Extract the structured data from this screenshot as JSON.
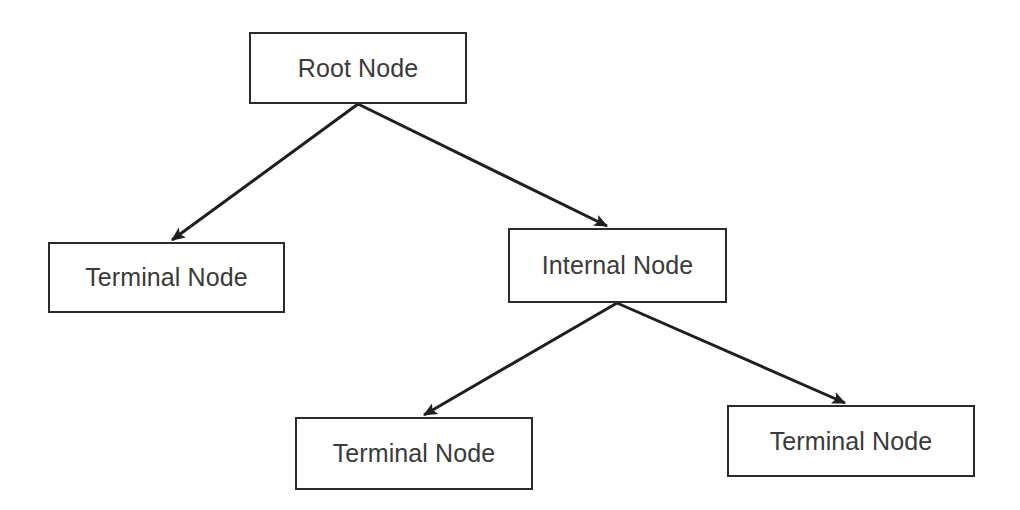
{
  "diagram": {
    "type": "tree-diagram",
    "canvas": {
      "width": 1020,
      "height": 510
    },
    "style": {
      "background_color": "#ffffff",
      "box_fill_color": "#ffffff",
      "box_border_color": "#2b2b2b",
      "box_border_width": 2,
      "text_color": "#3a3a3a",
      "edge_color": "#1f1f1f",
      "edge_width": 3,
      "font_size": 25
    },
    "nodes": [
      {
        "id": "root",
        "label": "Root Node",
        "x": 249,
        "y": 32,
        "width": 218,
        "height": 72,
        "level": 0
      },
      {
        "id": "terminal-1",
        "label": "Terminal Node",
        "x": 48,
        "y": 242,
        "width": 237,
        "height": 71,
        "level": 1
      },
      {
        "id": "internal",
        "label": "Internal Node",
        "x": 508,
        "y": 228,
        "width": 219,
        "height": 75,
        "level": 1
      },
      {
        "id": "terminal-2",
        "label": "Terminal Node",
        "x": 295,
        "y": 417,
        "width": 238,
        "height": 73,
        "level": 2
      },
      {
        "id": "terminal-3",
        "label": "Terminal Node",
        "x": 727,
        "y": 405,
        "width": 248,
        "height": 72,
        "level": 2
      }
    ],
    "edges": [
      {
        "id": "root-to-terminal-1",
        "from": "root",
        "to": "terminal-1",
        "x1": 358,
        "y1": 104,
        "x2": 172,
        "y2": 240,
        "arrowhead": "filled-triangle"
      },
      {
        "id": "root-to-internal",
        "from": "root",
        "to": "internal",
        "x1": 358,
        "y1": 104,
        "x2": 607,
        "y2": 226,
        "arrowhead": "filled-triangle"
      },
      {
        "id": "internal-to-terminal-2",
        "from": "internal",
        "to": "terminal-2",
        "x1": 617,
        "y1": 303,
        "x2": 424,
        "y2": 415,
        "arrowhead": "filled-triangle"
      },
      {
        "id": "internal-to-terminal-3",
        "from": "internal",
        "to": "terminal-3",
        "x1": 617,
        "y1": 303,
        "x2": 845,
        "y2": 403,
        "arrowhead": "filled-triangle"
      }
    ]
  }
}
